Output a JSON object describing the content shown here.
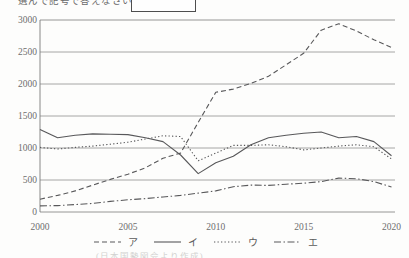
{
  "page": {
    "top_text_partial": "選んで記号で答えなさい。",
    "answer_box_value": "",
    "source_caption_partial": "(日本国勢図会より作成)"
  },
  "chart_data": {
    "type": "line",
    "title": "",
    "xlabel": "",
    "ylabel": "",
    "x": [
      2000,
      2001,
      2002,
      2003,
      2004,
      2005,
      2006,
      2007,
      2008,
      2009,
      2010,
      2011,
      2012,
      2013,
      2014,
      2015,
      2016,
      2017,
      2018,
      2019,
      2020
    ],
    "x_tick_labels": [
      "2000",
      "2005",
      "2010",
      "2015",
      "2020"
    ],
    "x_ticks": [
      2000,
      2005,
      2010,
      2015,
      2020
    ],
    "ylim": [
      0,
      3000
    ],
    "y_ticks": [
      0,
      500,
      1000,
      1500,
      2000,
      2500,
      3000
    ],
    "grid": "horizontal",
    "legend_position": "bottom",
    "line_color": "#58585a",
    "grid_color": "#8f8f8f",
    "label_color": "#6e6e6e",
    "series": [
      {
        "name": "ア",
        "style": "dashed",
        "values": [
          200,
          260,
          330,
          420,
          510,
          590,
          690,
          840,
          920,
          1400,
          1870,
          1920,
          2010,
          2120,
          2300,
          2480,
          2840,
          2940,
          2830,
          2690,
          2570
        ]
      },
      {
        "name": "イ",
        "style": "solid",
        "values": [
          1290,
          1160,
          1200,
          1220,
          1215,
          1210,
          1160,
          1100,
          890,
          600,
          770,
          870,
          1050,
          1160,
          1200,
          1230,
          1250,
          1160,
          1180,
          1100,
          880
        ]
      },
      {
        "name": "ウ",
        "style": "dotted",
        "values": [
          1010,
          985,
          1010,
          1030,
          1060,
          1090,
          1140,
          1190,
          1180,
          800,
          920,
          1040,
          1040,
          1050,
          1020,
          970,
          1000,
          1030,
          1050,
          1020,
          830
        ]
      },
      {
        "name": "エ",
        "style": "dashdot",
        "values": [
          95,
          100,
          115,
          135,
          165,
          190,
          210,
          235,
          260,
          295,
          330,
          395,
          420,
          415,
          435,
          450,
          475,
          530,
          520,
          475,
          390
        ]
      }
    ]
  }
}
